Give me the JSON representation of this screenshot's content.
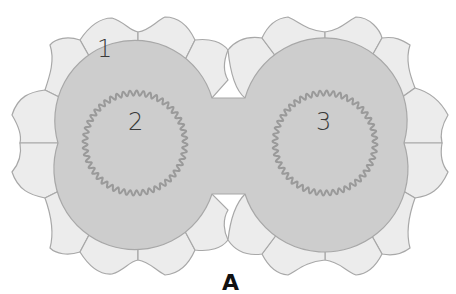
{
  "figure": {
    "panel_label": "A",
    "labels": {
      "outer_cell": "1",
      "left_core": "2",
      "right_core": "3"
    },
    "colors": {
      "background": "#ffffff",
      "outer_cells": "#ececec",
      "core_fill": "#cdcdcd",
      "outline": "#a8a8a8",
      "wavy_ring": "#9a9a9a",
      "text": "#3a3a3a"
    }
  }
}
